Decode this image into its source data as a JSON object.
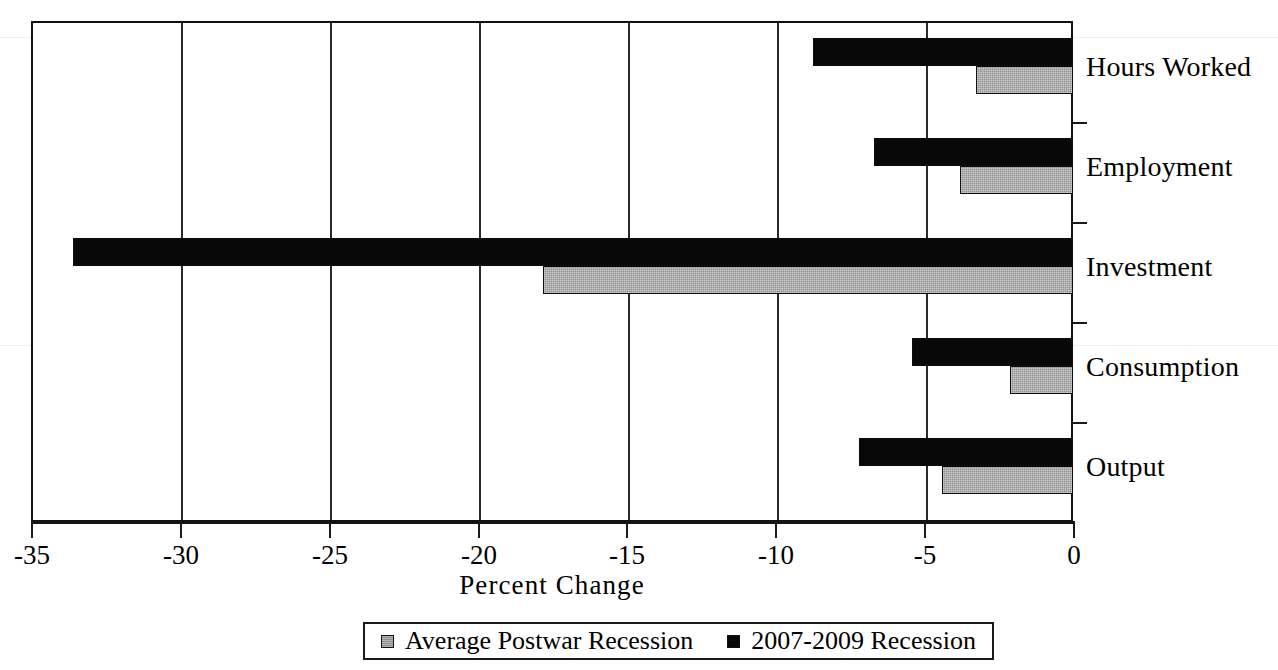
{
  "chart_data": {
    "type": "bar",
    "orientation": "horizontal",
    "title": "",
    "xlabel": "Percent Change",
    "ylabel": "",
    "xlim": [
      -35,
      0
    ],
    "xticks": [
      "-35",
      "-30",
      "-25",
      "-20",
      "-15",
      "-10",
      "-5",
      "0"
    ],
    "xtick_values": [
      -35,
      -30,
      -25,
      -20,
      -15,
      -10,
      -5,
      0
    ],
    "grid": true,
    "grid_axis": "x",
    "legend_position": "bottom",
    "categories": [
      "Hours Worked",
      "Employment",
      "Investment",
      "Consumption",
      "Output"
    ],
    "series": [
      {
        "name": "Average Postwar Recession",
        "color": "#8f8f8f",
        "values": [
          -3.25,
          -3.8,
          -17.8,
          -2.1,
          -4.4
        ]
      },
      {
        "name": "2007-2009 Recession",
        "color": "#080808",
        "values": [
          -8.75,
          -6.7,
          -33.6,
          -5.4,
          -7.2
        ]
      }
    ]
  },
  "legend": {
    "items": [
      {
        "label": "Average Postwar Recession",
        "swatch": "gray"
      },
      {
        "label": "2007-2009 Recession",
        "swatch": "black"
      }
    ]
  },
  "axis": {
    "x_title": "Percent Change"
  },
  "colors": {
    "series_gray": "#8f8f8f",
    "series_black": "#080808",
    "frame": "#111111",
    "background": "#ffffff"
  }
}
